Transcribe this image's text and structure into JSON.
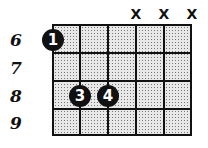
{
  "diagram": {
    "type": "guitar-chord-chart",
    "fret_labels": [
      "6",
      "7",
      "8",
      "9"
    ],
    "muted_strings": [
      {
        "string": 4,
        "label": "X"
      },
      {
        "string": 5,
        "label": "X"
      },
      {
        "string": 6,
        "label": "X"
      }
    ],
    "fingers": [
      {
        "string": 1,
        "fret": 6,
        "finger": "1"
      },
      {
        "string": 2,
        "fret": 8,
        "finger": "3"
      },
      {
        "string": 3,
        "fret": 8,
        "finger": "4"
      }
    ]
  }
}
